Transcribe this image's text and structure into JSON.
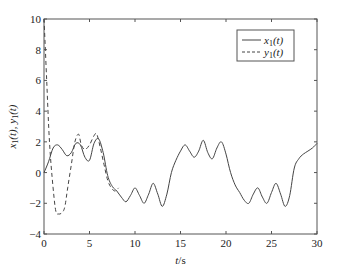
{
  "chart_data": {
    "type": "line",
    "title": "",
    "xlabel": "t/s",
    "ylabel": "x1(t), y1(t)",
    "xlim": [
      0,
      30
    ],
    "ylim": [
      -4,
      10
    ],
    "xticks": [
      0,
      5,
      10,
      15,
      20,
      25,
      30
    ],
    "yticks": [
      -4,
      -2,
      0,
      2,
      4,
      6,
      8,
      10
    ],
    "grid": false,
    "legend_position": "upper right",
    "series": [
      {
        "name": "x1(t)",
        "style": "solid",
        "color": "#444444",
        "x": [
          0,
          0.5,
          1,
          1.5,
          2,
          2.5,
          3,
          3.5,
          4,
          4.5,
          5,
          5.5,
          6,
          6.5,
          7,
          7.5,
          8,
          8.5,
          9,
          9.5,
          10,
          10.5,
          11,
          11.5,
          12,
          12.5,
          13,
          13.5,
          14,
          14.5,
          15,
          15.5,
          16,
          16.5,
          17,
          17.5,
          18,
          18.5,
          19,
          19.5,
          20,
          20.5,
          21,
          21.5,
          22,
          22.5,
          23,
          23.5,
          24,
          24.5,
          25,
          25.5,
          26,
          26.5,
          27,
          27.5,
          28,
          28.5,
          29,
          29.5,
          30
        ],
        "y": [
          0,
          0.7,
          1.6,
          1.8,
          1.5,
          1.1,
          1.3,
          1.9,
          1.8,
          1.0,
          0.8,
          1.9,
          2.2,
          1.3,
          -0.2,
          -0.9,
          -1.2,
          -1.6,
          -1.9,
          -1.5,
          -1.0,
          -1.5,
          -2.0,
          -1.4,
          -0.7,
          -1.4,
          -2.2,
          -1.4,
          0.0,
          0.8,
          1.4,
          1.8,
          1.4,
          1.0,
          1.4,
          2.1,
          1.3,
          0.9,
          1.6,
          2.0,
          1.2,
          0.0,
          -0.8,
          -1.3,
          -1.8,
          -2.0,
          -1.4,
          -1.0,
          -1.6,
          -2.0,
          -1.3,
          -0.7,
          -1.4,
          -2.2,
          -1.5,
          0.3,
          0.9,
          1.2,
          1.4,
          1.6,
          1.9
        ]
      },
      {
        "name": "y1(t)",
        "style": "dashed",
        "color": "#444444",
        "x": [
          0,
          0.3,
          0.6,
          1,
          1.3,
          1.6,
          2,
          2.3,
          2.6,
          3,
          3.4,
          3.8,
          4.1,
          4.5,
          5,
          5.5,
          5.8,
          6.2,
          6.6,
          7,
          7.4,
          7.8,
          8.2
        ],
        "y": [
          10,
          6,
          2,
          -1,
          -2.5,
          -2.7,
          -2.6,
          -2.2,
          -1.0,
          0.5,
          2.0,
          2.5,
          1.8,
          1.5,
          1.8,
          2.4,
          2.5,
          1.6,
          0.5,
          -0.5,
          -1.0,
          -1.2,
          -1.0
        ]
      }
    ]
  },
  "legend": {
    "items": [
      {
        "label": "x1(t)",
        "base": "x",
        "sub": "1",
        "arg": "(t)"
      },
      {
        "label": "y1(t)",
        "base": "y",
        "sub": "1",
        "arg": "(t)"
      }
    ]
  },
  "axes": {
    "xlabel": "t/s",
    "ylabel": "x1(t), y1(t)"
  }
}
